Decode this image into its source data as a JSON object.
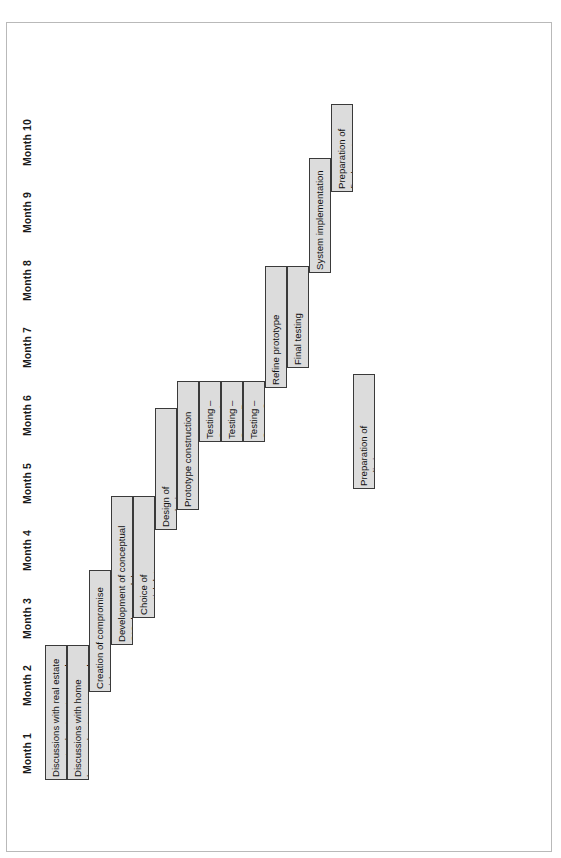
{
  "figure": {
    "type": "gantt",
    "orientation": "rotated-90-ccw",
    "axis_title": "",
    "border_color": "#b9b9b9",
    "bar_fill": "#dcdcdc",
    "bar_stroke": "#3a3a3a"
  },
  "axis": {
    "name": "month-axis",
    "ticks": [
      {
        "label": "Month 1"
      },
      {
        "label": "Month 2"
      },
      {
        "label": "Month 3"
      },
      {
        "label": "Month 4"
      },
      {
        "label": "Month 5"
      },
      {
        "label": "Month 6"
      },
      {
        "label": "Month 7"
      },
      {
        "label": "Month 8"
      },
      {
        "label": "Month 9"
      },
      {
        "label": "Month 10"
      }
    ]
  },
  "chart_data": {
    "type": "bar",
    "title": "",
    "xlabel": "",
    "ylabel": "",
    "categories": [
      "Discussions with real estate agents about system needs",
      "Discussions with home buyers about system needs",
      "Creation of compromise rich picture and root definition",
      "Development of conceptual GIS data model",
      "Choice of spatial data model",
      "Design of analysis scheme",
      "Prototype construction",
      "Testing – Group A Estate agents",
      "Testing – Group B Home buyers",
      "Testing – Group C Independent",
      "Refine prototype",
      "Final testing",
      "System implementation",
      "Preparation of final report",
      "Preparation of preliminary report"
    ],
    "axis_ticks": [
      "Month 1",
      "Month 2",
      "Month 3",
      "Month 4",
      "Month 5",
      "Month 6",
      "Month 7",
      "Month 8",
      "Month 9",
      "Month 10"
    ],
    "xlim": [
      1,
      11
    ],
    "grid": false,
    "legend": "none",
    "tasks": [
      {
        "label": "Discussions with real estate\nagents about system needs",
        "start_month": 1.0,
        "end_month": 3.0,
        "row": 0,
        "rows_span": 1
      },
      {
        "label": "Discussions with home\nbuyers about system needs",
        "start_month": 1.0,
        "end_month": 3.0,
        "row": 1,
        "rows_span": 1
      },
      {
        "label": "Creation of compromise rich\npicture and root definition",
        "start_month": 2.3,
        "end_month": 4.1,
        "row": 2,
        "rows_span": 1
      },
      {
        "label": "Development of conceptual\nGIS data model",
        "start_month": 3.0,
        "end_month": 5.2,
        "row": 3,
        "rows_span": 1
      },
      {
        "label": "Choice of\nspatial data\nmodel",
        "start_month": 3.4,
        "end_month": 5.2,
        "row": 4,
        "rows_span": 1
      },
      {
        "label": "Design of\nanalysis\nscheme",
        "start_month": 4.7,
        "end_month": 6.5,
        "row": 5,
        "rows_span": 1
      },
      {
        "label": "Prototype construction",
        "start_month": 5.0,
        "end_month": 6.9,
        "row": 6,
        "rows_span": 1
      },
      {
        "label": "Testing – Group A\nEstate agents",
        "start_month": 6.0,
        "end_month": 6.9,
        "row": 7,
        "rows_span": 1
      },
      {
        "label": "Testing – Group B\nHome buyers",
        "start_month": 6.0,
        "end_month": 6.9,
        "row": 8,
        "rows_span": 1
      },
      {
        "label": "Testing – Group C\nIndependent",
        "start_month": 6.0,
        "end_month": 6.9,
        "row": 9,
        "rows_span": 1
      },
      {
        "label": "Refine prototype",
        "start_month": 6.8,
        "end_month": 8.6,
        "row": 10,
        "rows_span": 1
      },
      {
        "label": "Final testing",
        "start_month": 7.1,
        "end_month": 8.6,
        "row": 11,
        "rows_span": 1
      },
      {
        "label": "System implementation",
        "start_month": 8.5,
        "end_month": 10.2,
        "row": 12,
        "rows_span": 1
      },
      {
        "label": "Preparation of\nfinal report",
        "start_month": 9.7,
        "end_month": 11.0,
        "row": 13,
        "rows_span": 1
      },
      {
        "label": "Preparation of\npreliminary\nreport",
        "start_month": 5.3,
        "end_month": 7.0,
        "row": 14,
        "rows_span": 1
      }
    ]
  }
}
